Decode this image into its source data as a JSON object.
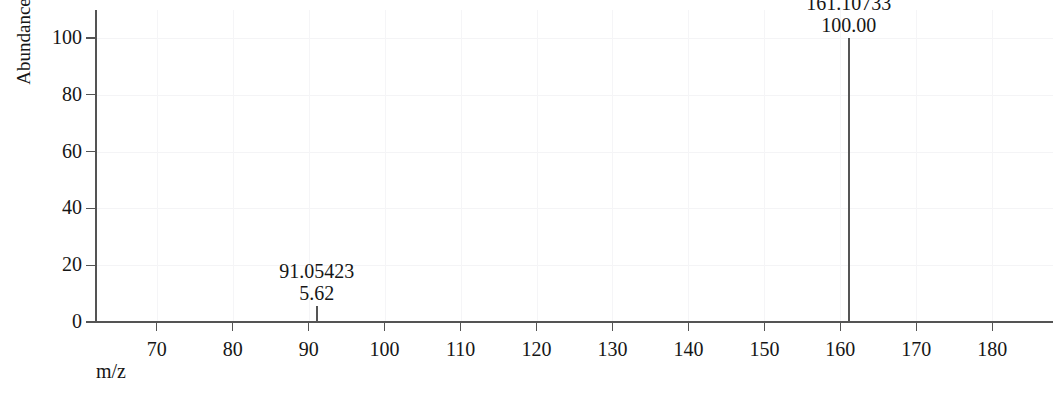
{
  "chart_data": {
    "type": "bar",
    "title": "",
    "subtitle": "",
    "xlabel": "m/z",
    "ylabel": "Abundance",
    "xlim": [
      62,
      188
    ],
    "ylim": [
      0,
      100
    ],
    "x_ticks": [
      70,
      80,
      90,
      100,
      110,
      120,
      130,
      140,
      150,
      160,
      170,
      180
    ],
    "x_tick_labels": [
      "70",
      "80",
      "90",
      "100",
      "110",
      "120",
      "130",
      "140",
      "150",
      "160",
      "170",
      "180"
    ],
    "y_ticks": [
      0,
      20,
      40,
      60,
      80,
      100
    ],
    "y_tick_labels": [
      "0",
      "20",
      "40",
      "60",
      "80",
      "100"
    ],
    "grid": false,
    "legend": "none",
    "series": [
      {
        "name": "mass spectrum",
        "peaks": [
          {
            "mz": 91.05423,
            "intensity": 5.62,
            "mz_label": "91.05423",
            "intensity_label": "5.62"
          },
          {
            "mz": 161.10733,
            "intensity": 100.0,
            "mz_label": "161.10733",
            "intensity_label": "100.00"
          }
        ]
      }
    ]
  },
  "axes": {
    "y_title": "Abundance",
    "x_title": "m/z"
  },
  "colors": {
    "peak": "#555555",
    "axis": "#545454",
    "text": "#161616",
    "background": "#ffffff"
  }
}
